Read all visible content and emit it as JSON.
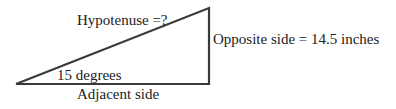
{
  "diagram": {
    "type": "right-triangle",
    "labels": {
      "hypotenuse": "Hypotenuse =?",
      "opposite": "Opposite side = 14.5 inches",
      "angle": "15 degrees",
      "adjacent": "Adjacent side"
    },
    "values": {
      "angle_degrees": 15,
      "opposite_length": 14.5,
      "opposite_unit": "inches"
    },
    "stroke_color": "#3a3a3a"
  }
}
